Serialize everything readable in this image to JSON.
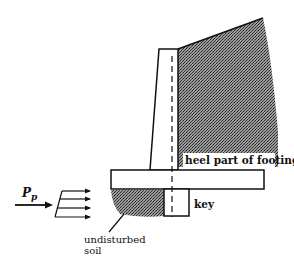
{
  "diagram": {
    "type": "retaining-wall-with-shear-key",
    "labels": {
      "heel": "heel part of footing",
      "key": "key",
      "soil_line1": "undisturbed",
      "soil_line2": "soil",
      "force_main": "P",
      "force_sub": "p"
    },
    "colors": {
      "line": "#111111",
      "soil_dark": "#555555",
      "soil_light": "#bbbbbb",
      "background": "#ffffff"
    },
    "elements": [
      "stem",
      "footing",
      "key",
      "backfill-soil",
      "undisturbed-soil",
      "passive-pressure-arrows",
      "centerline"
    ]
  }
}
